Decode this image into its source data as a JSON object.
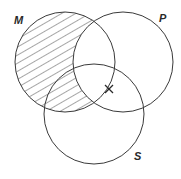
{
  "diagram": {
    "type": "venn-3-set",
    "sets": [
      {
        "id": "M",
        "label": "M",
        "cx": 65,
        "cy": 62,
        "r": 50,
        "label_x": 14,
        "label_y": 24
      },
      {
        "id": "P",
        "label": "P",
        "cx": 123,
        "cy": 62,
        "r": 50,
        "label_x": 159,
        "label_y": 22
      },
      {
        "id": "S",
        "label": "S",
        "cx": 94,
        "cy": 114,
        "r": 50,
        "label_x": 134,
        "label_y": 160
      }
    ],
    "shaded_region": "M minus P",
    "marker": {
      "symbol": "X",
      "x": 109,
      "y": 89,
      "on_boundary": "P circle within M∩S"
    },
    "colors": {
      "stroke": "#3a3a3a",
      "background": "#ffffff",
      "hatch": "#3a3a3a"
    }
  }
}
